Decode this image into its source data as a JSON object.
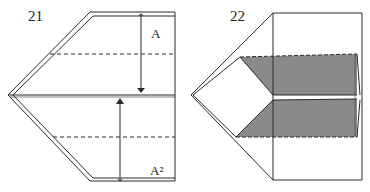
{
  "diagrams": [
    {
      "step": "21",
      "labels": {
        "top_arrow": "A",
        "bottom_arrow": "A²"
      },
      "description": "Paper airplane folding: fold top and bottom flaps to the center line"
    },
    {
      "step": "22",
      "description": "Result after folding: shaded flaps meeting at center"
    }
  ],
  "colors": {
    "line": "#2a2a2a",
    "shade": "#8a8a8a",
    "background": "#ffffff"
  }
}
